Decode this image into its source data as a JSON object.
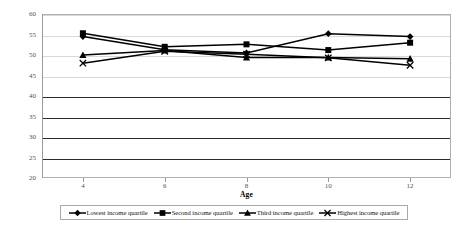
{
  "chart_data": {
    "type": "line",
    "title": "",
    "xlabel": "Age",
    "ylabel": "Score percentile",
    "categories": [
      4,
      6,
      8,
      10,
      12
    ],
    "x": [
      4,
      6,
      8,
      10,
      12
    ],
    "xlim": [
      3,
      13
    ],
    "ylim": [
      20,
      60
    ],
    "ytick_values": [
      60,
      55,
      50,
      45,
      40,
      35,
      30,
      25,
      20
    ],
    "ytick_labels": [
      "60",
      "55",
      "50",
      "45",
      "40",
      "35",
      "30",
      "25",
      "20"
    ],
    "xtick_labels": [
      "4",
      "6",
      "8",
      "10",
      "12"
    ],
    "grid": true,
    "legend_position": "bottom",
    "series": [
      {
        "name": "Lowest income quartile",
        "marker": "diamond",
        "values": [
          54.5,
          51.3,
          50.5,
          55.2,
          54.5
        ]
      },
      {
        "name": "Second income quartile",
        "marker": "square",
        "values": [
          55.3,
          52.0,
          52.6,
          51.2,
          53.0
        ]
      },
      {
        "name": "Third income quartile",
        "marker": "triangle",
        "values": [
          50.0,
          51.1,
          49.4,
          49.4,
          49.1
        ]
      },
      {
        "name": "Highest income quartile",
        "marker": "cross",
        "values": [
          48.0,
          50.9,
          50.2,
          49.3,
          47.5
        ]
      }
    ]
  },
  "axes": {
    "y_title": "Score percentile",
    "x_title": "Age",
    "y_labels": [
      "60",
      "55",
      "50",
      "45",
      "40",
      "35",
      "30",
      "25",
      "20"
    ],
    "x_labels": [
      "4",
      "6",
      "8",
      "10",
      "12"
    ]
  },
  "legend": {
    "items": [
      {
        "label": "Lowest income quartile",
        "marker": "diamond-marker-icon"
      },
      {
        "label": "Second income quartile",
        "marker": "square-marker-icon"
      },
      {
        "label": "Third income quartile",
        "marker": "triangle-marker-icon"
      },
      {
        "label": "Highest income quartile",
        "marker": "cross-marker-icon"
      }
    ]
  },
  "colors": {
    "series_line": "#000000",
    "gridline_light": "#d9d9d9",
    "gridline_dark": "#2b2b2b",
    "frame": "#b0b0b0",
    "tick_text": "#555555",
    "background": "#ffffff"
  }
}
